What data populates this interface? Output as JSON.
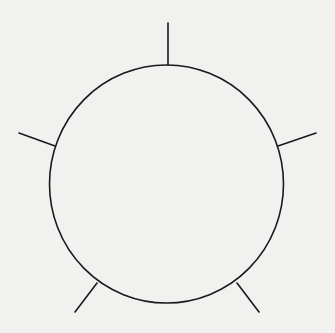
{
  "diagram": {
    "shape": "circle",
    "spoke_count": 5,
    "spoke_directions": [
      "top",
      "upper-left",
      "upper-right",
      "lower-left",
      "lower-right"
    ],
    "stroke_color": "#1a1a1a",
    "background_color": "#f1f1f0",
    "labels": []
  }
}
